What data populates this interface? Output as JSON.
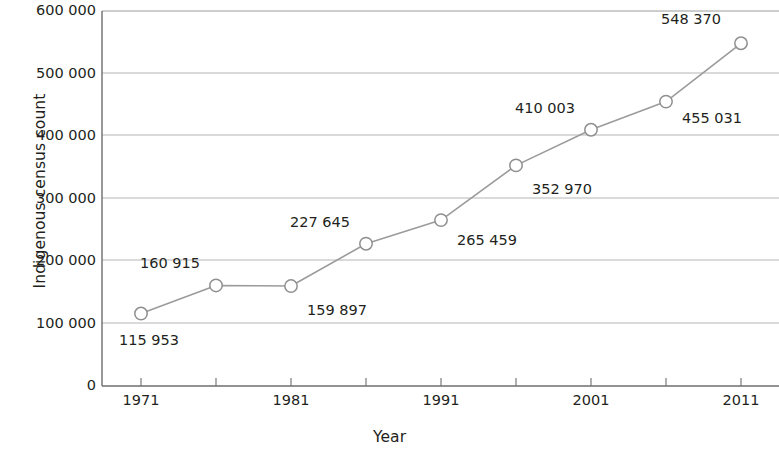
{
  "chart_data": {
    "type": "line",
    "title": "",
    "xlabel": "Year",
    "ylabel": "Indigenous census count",
    "x": [
      1971,
      1976,
      1981,
      1986,
      1991,
      1996,
      2001,
      2006,
      2011
    ],
    "values": [
      115953,
      160915,
      159897,
      227645,
      265459,
      352970,
      410003,
      455031,
      548370
    ],
    "point_labels": [
      "115 953",
      "160 915",
      "159 897",
      "227 645",
      "265 459",
      "352 970",
      "410 003",
      "455 031",
      "548 370"
    ],
    "xlim": [
      1971,
      2011
    ],
    "ylim": [
      0,
      600000
    ],
    "ytick_labels": [
      "600 000",
      "500 000",
      "400 000",
      "300 000",
      "200 000",
      "100 000",
      "0"
    ],
    "ytick_values": [
      600000,
      500000,
      400000,
      300000,
      200000,
      100000,
      0
    ],
    "xtick_labels": [
      "1971",
      "1981",
      "1991",
      "2001",
      "2011"
    ],
    "xtick_values": [
      1971,
      1981,
      1991,
      2001,
      2011
    ],
    "xminor_values": [
      1976,
      1986,
      1996,
      2006
    ],
    "grid": "horizontal",
    "legend": "none",
    "series_color": "#8c8c8c",
    "marker": "open-circle",
    "axis_color": "#6e6e6e",
    "text_color": "#231f20"
  }
}
